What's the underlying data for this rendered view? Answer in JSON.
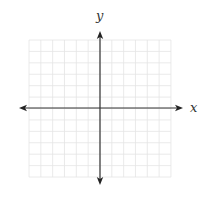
{
  "diagram": {
    "type": "coordinate-plane",
    "x_axis_label": "x",
    "y_axis_label": "y",
    "grid": {
      "cells_x": 12,
      "cells_y": 12,
      "cells_each_side": 6,
      "left": 29,
      "top": 40,
      "cell_w": 11.83,
      "cell_h": 11.42,
      "line_color": "#e4e4e4",
      "axis_color": "#333333"
    },
    "origin": {
      "x": 100,
      "y": 108
    },
    "x_axis": {
      "start": 19,
      "end": 183,
      "arrows": "both"
    },
    "y_axis": {
      "start": 31,
      "end": 185,
      "arrows": "both"
    },
    "labels": {
      "x": {
        "x": 190,
        "y": 112
      },
      "y": {
        "x": 96,
        "y": 20
      }
    }
  }
}
